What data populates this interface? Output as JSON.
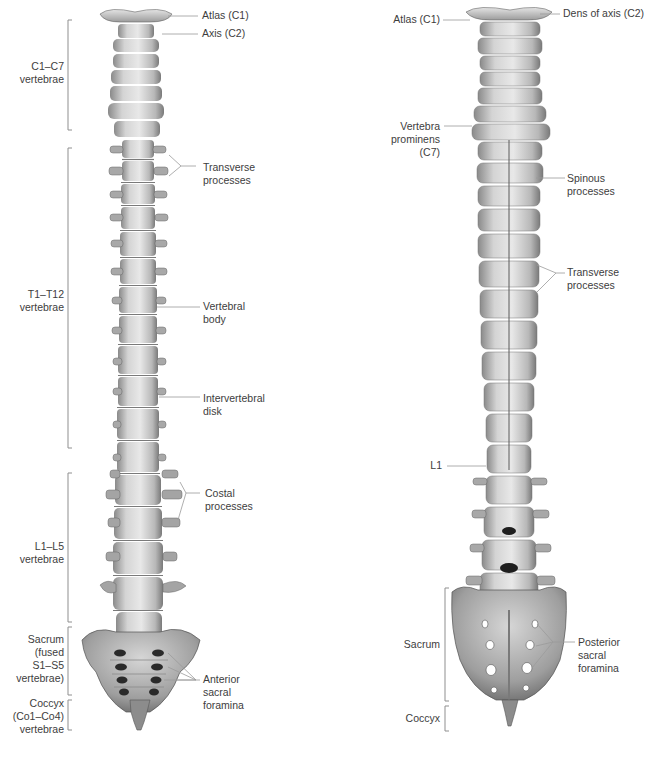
{
  "figure": {
    "views": [
      {
        "id": "anterior",
        "region_labels": [
          {
            "text": "C1–C7\nvertebrae",
            "bracket": [
              8,
              158
            ]
          },
          {
            "text": "T1–T12\nvertebrae",
            "bracket": [
              148,
              448
            ]
          },
          {
            "text": "L1–L5\nvertebrae",
            "bracket": [
              473,
              622
            ]
          },
          {
            "text": "Sacrum\n(fused\nS1–S5\nvertebrae)",
            "bracket": [
              627,
              695
            ]
          },
          {
            "text": "Coccyx\n(Co1–Co4)\nvertebrae",
            "bracket": [
              700,
              730
            ]
          }
        ],
        "structure_labels": [
          {
            "text": "Atlas (C1)"
          },
          {
            "text": "Axis (C2)"
          },
          {
            "text": "Transverse\nprocesses"
          },
          {
            "text": "Vertebral\nbody"
          },
          {
            "text": "Intervertebral\ndisk"
          },
          {
            "text": "Costal\nprocesses"
          },
          {
            "text": "Anterior\nsacral\nforamina"
          }
        ]
      },
      {
        "id": "posterior",
        "region_labels": [
          {
            "text": "Sacrum",
            "bracket": [
              588,
              701
            ]
          },
          {
            "text": "Coccyx",
            "bracket": [
              706,
              731
            ]
          }
        ],
        "structure_labels": [
          {
            "text": "Atlas (C1)"
          },
          {
            "text": "Dens of axis (C2)"
          },
          {
            "text": "Vertebra\nprominens\n(C7)"
          },
          {
            "text": "Spinous\nprocesses"
          },
          {
            "text": "Transverse\nprocesses"
          },
          {
            "text": "L1"
          },
          {
            "text": "Posterior\nsacral\nforamina"
          }
        ]
      }
    ],
    "colors": {
      "background": "#ffffff",
      "bone_light": "#e6e6e6",
      "bone_mid": "#bdbdbd",
      "bone_dark": "#6e6e6e",
      "foramen": "#1e1e1e",
      "leader_line": "#9a9a9a",
      "text": "#3d3d3d"
    }
  }
}
